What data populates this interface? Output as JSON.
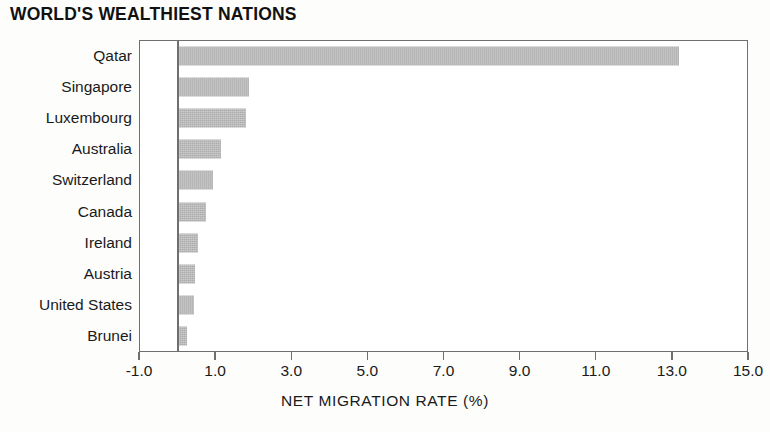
{
  "chart_data": {
    "type": "bar",
    "orientation": "horizontal",
    "title": "WORLD'S WEALTHIEST NATIONS",
    "xlabel": "NET MIGRATION RATE (%)",
    "ylabel": "",
    "categories": [
      "Qatar",
      "Singapore",
      "Luxembourg",
      "Australia",
      "Switzerland",
      "Canada",
      "Ireland",
      "Austria",
      "United States",
      "Brunei"
    ],
    "values": [
      13.2,
      1.9,
      1.8,
      1.15,
      0.95,
      0.75,
      0.55,
      0.47,
      0.45,
      0.25
    ],
    "xlim": [
      -1.0,
      15.0
    ],
    "xticks": [
      -1.0,
      1.0,
      3.0,
      5.0,
      7.0,
      9.0,
      11.0,
      13.0,
      15.0
    ],
    "xtick_labels": [
      "-1.0",
      "1.0",
      "3.0",
      "5.0",
      "7.0",
      "9.0",
      "11.0",
      "13.0",
      "15.0"
    ],
    "grid": false,
    "legend": "none",
    "bar_color": "#adadad",
    "axis_color": "#6f6f6f",
    "background": "#ffffff"
  }
}
